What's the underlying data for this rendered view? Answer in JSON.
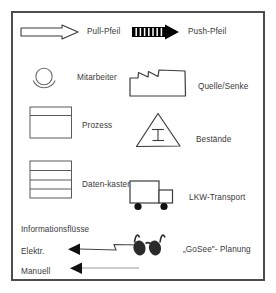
{
  "panel": {
    "border_color": "#4d4d4d",
    "background": "#ffffff",
    "text_color": "#3a3a3a"
  },
  "legend": {
    "title_row": {
      "label": "Informationsflüsse"
    },
    "entries": [
      {
        "id": "pull-arrow",
        "icon": "outlined-arrow-right-icon",
        "label": "Pull-Pfeil",
        "column": "left"
      },
      {
        "id": "push-arrow",
        "icon": "striped-arrow-right-icon",
        "label": "Push-Pfeil",
        "column": "right"
      },
      {
        "id": "operator",
        "icon": "operator-circle-icon",
        "label": "Mitarbeiter",
        "column": "left"
      },
      {
        "id": "source-sink",
        "icon": "factory-icon",
        "label": "Quelle/Senke",
        "column": "right"
      },
      {
        "id": "process",
        "icon": "process-box-icon",
        "label": "Prozess",
        "column": "left"
      },
      {
        "id": "inventory",
        "icon": "inventory-triangle-icon",
        "label": "Bestände",
        "column": "right"
      },
      {
        "id": "data-box",
        "icon": "data-box-icon",
        "label": "Daten-kasten",
        "column": "left"
      },
      {
        "id": "truck",
        "icon": "truck-icon",
        "label": "LKW-Transport",
        "column": "right"
      },
      {
        "id": "electronic",
        "icon": "zigzag-arrow-left-icon",
        "label": "Elektr.",
        "column": "left"
      },
      {
        "id": "gosee",
        "icon": "glasses-icon",
        "label": "„GoSee\"- Planung",
        "column": "right"
      },
      {
        "id": "manual",
        "icon": "straight-arrow-left-icon",
        "label": "Manuell",
        "column": "left"
      }
    ]
  }
}
